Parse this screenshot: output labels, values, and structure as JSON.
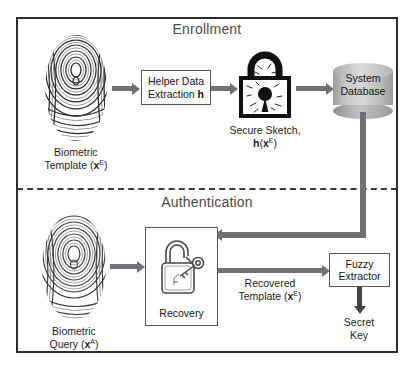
{
  "figure": {
    "frame_color": "#2b2b2b",
    "arrow_color": "#6f7176",
    "database_color": "#c9c9c9"
  },
  "sections": {
    "enrollment": {
      "title": "Enrollment"
    },
    "authentication": {
      "title": "Authentication"
    }
  },
  "enrollment": {
    "fingerprint_caption_line1": "Biometric",
    "fingerprint_caption_line2_pre": "Template (",
    "fingerprint_caption_var": "x",
    "fingerprint_caption_sup": "E",
    "fingerprint_caption_line2_post": ")",
    "helper_box_line1": "Helper Data",
    "helper_box_line2_pre": "Extraction ",
    "helper_box_line2_bold": "h",
    "lock_caption_line1": "Secure Sketch,",
    "lock_caption_line2_fn": "h",
    "lock_caption_line2_open": "(",
    "lock_caption_line2_var": "x",
    "lock_caption_line2_sup": "E",
    "lock_caption_line2_close": ")",
    "database_line1": "System",
    "database_line2": "Database"
  },
  "authentication": {
    "fingerprint_caption_line1": "Biometric",
    "fingerprint_caption_line2_pre": "Query (",
    "fingerprint_caption_var": "x",
    "fingerprint_caption_sup": "A",
    "fingerprint_caption_line2_post": ")",
    "recovery_box_label": "Recovery",
    "recovered_caption_line1": "Recovered",
    "recovered_caption_line2_pre": "Template (",
    "recovered_caption_var": "x",
    "recovered_caption_sup": "E",
    "recovered_caption_line2_post": ")",
    "fuzzy_box_line1": "Fuzzy",
    "fuzzy_box_line2": "Extractor",
    "secret_key_line1": "Secret",
    "secret_key_line2": "Key"
  }
}
